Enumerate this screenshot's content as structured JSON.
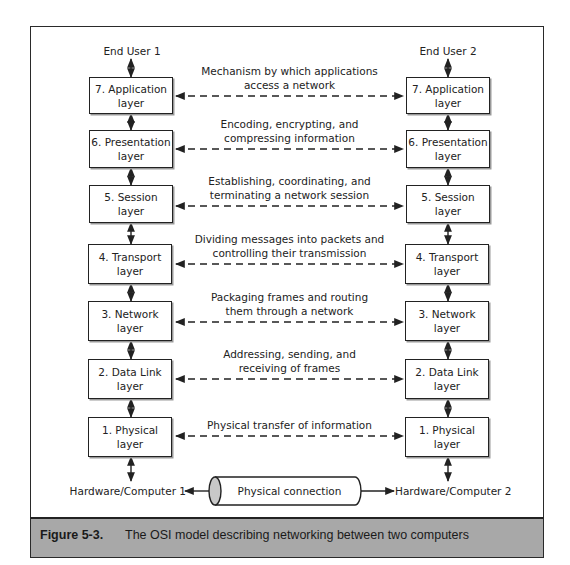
{
  "diagram": {
    "type": "osi-model-comparison",
    "left_endpoint": {
      "top_label": "End User 1",
      "bottom_label": "Hardware/Computer 1"
    },
    "right_endpoint": {
      "top_label": "End User 2",
      "bottom_label": "Hardware/Computer 2"
    },
    "layers": [
      {
        "label_line1": "7. Application",
        "label_line2": "layer",
        "description_line1": "Mechanism by which applications",
        "description_line2": "access a network"
      },
      {
        "label_line1": "6. Presentation",
        "label_line2": "layer",
        "description_line1": "Encoding, encrypting, and",
        "description_line2": "compressing information"
      },
      {
        "label_line1": "5. Session layer",
        "label_line2": "",
        "description_line1": "Establishing, coordinating, and",
        "description_line2": "terminating a network session"
      },
      {
        "label_line1": "4. Transport layer",
        "label_line2": "",
        "description_line1": "Dividing messages into packets and",
        "description_line2": "controlling their transmission"
      },
      {
        "label_line1": "3. Network layer",
        "label_line2": "",
        "description_line1": "Packaging frames and routing",
        "description_line2": "them through a network"
      },
      {
        "label_line1": "2. Data Link layer",
        "label_line2": "",
        "description_line1": "Addressing, sending, and",
        "description_line2": "receiving of frames"
      },
      {
        "label_line1": "1. Physical layer",
        "label_line2": "",
        "description_line1": "Physical transfer of information",
        "description_line2": ""
      }
    ],
    "physical_connection_label": "Physical connection"
  },
  "caption": {
    "figure_number": "Figure 5-3.",
    "text": "The OSI model describing networking between two computers"
  },
  "colors": {
    "line": "#222222",
    "caption_band": "#a8a8a8",
    "cylinder_cap": "#c8c8c8"
  }
}
